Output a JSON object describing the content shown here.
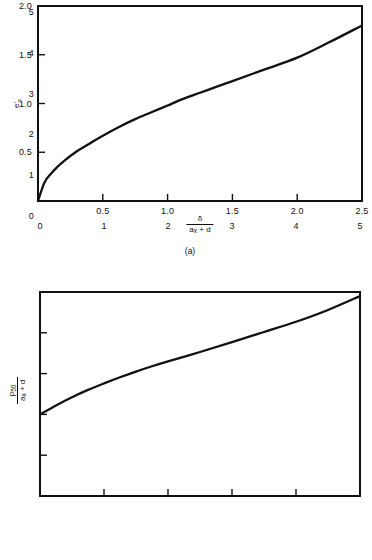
{
  "page": {
    "width": 372,
    "height": 560,
    "background": "#ffffff",
    "ink_color": "#111111"
  },
  "panels": [
    {
      "id": "a",
      "caption": "(a)",
      "xlabel_numerator": "δ",
      "xlabel_denominator_a": "a",
      "xlabel_denominator_sub": "x",
      "xlabel_denominator_b": " + d",
      "ylabel": "e'",
      "ylabel_sub": "x"
    },
    {
      "id": "b",
      "caption": "(b)",
      "xlabel_numerator": "δ",
      "xlabel_denominator_a": "a",
      "xlabel_denominator_sub": "x",
      "xlabel_denominator_b": " + d",
      "ylabel_numerator_a": "p",
      "ylabel_numerator_sub": "50",
      "ylabel_denominator_a": "a",
      "ylabel_denominator_sub": "x",
      "ylabel_denominator_b": " + d"
    }
  ],
  "chart_data": [
    {
      "type": "line",
      "panel": "(a)",
      "title": "",
      "xlabel": "δ / (a_x + d)",
      "ylabel": "e'_x",
      "xlim": [
        0,
        2.5
      ],
      "ylim": [
        0,
        2.0
      ],
      "xticks": [
        0.5,
        1.0,
        1.5,
        2.0,
        2.5
      ],
      "xticklabels": [
        "0.5",
        "1.0",
        "1.5",
        "2.0",
        "2.5"
      ],
      "yticks": [
        0.5,
        1.0,
        1.5,
        2.0
      ],
      "yticklabels": [
        "0.5",
        "1.0",
        "1.5",
        "2.0"
      ],
      "grid": false,
      "legend": null,
      "series": [
        {
          "name": "e'_x vs delta/(a_x+d)",
          "x": [
            0.0,
            0.05,
            0.1,
            0.15,
            0.2,
            0.3,
            0.4,
            0.5,
            0.625,
            0.75,
            0.875,
            1.0,
            1.125,
            1.25,
            1.375,
            1.5,
            1.75,
            2.0,
            2.25,
            2.5
          ],
          "y": [
            0.0,
            0.19,
            0.28,
            0.35,
            0.41,
            0.51,
            0.59,
            0.67,
            0.76,
            0.84,
            0.91,
            0.98,
            1.05,
            1.11,
            1.17,
            1.23,
            1.35,
            1.47,
            1.63,
            1.8
          ]
        }
      ]
    },
    {
      "type": "line",
      "panel": "(b)",
      "title": "",
      "xlabel": "δ / (a_x + d)",
      "ylabel": "p_50 / (a_x + d)",
      "xlim": [
        0,
        5
      ],
      "ylim": [
        0,
        5
      ],
      "xticks": [
        0,
        1,
        2,
        3,
        4,
        5
      ],
      "xticklabels": [
        "0",
        "1",
        "2",
        "3",
        "4",
        "5"
      ],
      "yticks": [
        0,
        1,
        2,
        3,
        4,
        5
      ],
      "yticklabels": [
        "0",
        "1",
        "2",
        "3",
        "4",
        "5"
      ],
      "grid": false,
      "legend": null,
      "series": [
        {
          "name": "p_50/(a_x+d) vs delta/(a_x+d)",
          "x": [
            0.0,
            0.25,
            0.5,
            0.75,
            1.0,
            1.25,
            1.5,
            1.75,
            2.0,
            2.5,
            3.0,
            3.5,
            4.0,
            4.5,
            5.0
          ],
          "y": [
            2.0,
            2.22,
            2.42,
            2.6,
            2.76,
            2.91,
            3.05,
            3.18,
            3.3,
            3.53,
            3.77,
            4.02,
            4.27,
            4.56,
            4.9
          ]
        }
      ]
    }
  ]
}
